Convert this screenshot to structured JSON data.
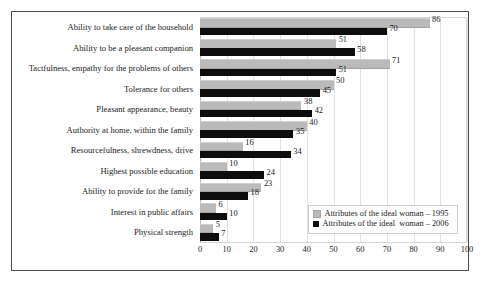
{
  "chart_data": {
    "type": "bar",
    "orientation": "horizontal",
    "title": "",
    "subtitle": "",
    "xlabel": "",
    "ylabel": "",
    "xlim": [
      0,
      100
    ],
    "xticks": [
      0,
      10,
      20,
      30,
      40,
      50,
      60,
      70,
      80,
      90,
      100
    ],
    "grid": true,
    "grid_axis": "x",
    "legend_position": "inside-bottom-right",
    "categories": [
      "Ability to take care of the household",
      "Ability to be a pleasant companion",
      "Tactfulness, empathy for the problems of others",
      "Tolerance for others",
      "Pleasant appearance, beauty",
      "Authority at home, within the family",
      "Resourcefulness, shrewdness, drive",
      "Highest possible education",
      "Ability to provide for the family",
      "Interest in public affairs",
      "Physical strength"
    ],
    "series": [
      {
        "name": "Attributes of the ideal woman – 1995",
        "color": "#bababa",
        "values": [
          86,
          51,
          71,
          50,
          38,
          40,
          16,
          10,
          23,
          6,
          5
        ]
      },
      {
        "name": "Attributes of the ideal  woman – 2006",
        "color": "#0d0d0d",
        "values": [
          70,
          58,
          51,
          45,
          42,
          35,
          34,
          24,
          18,
          10,
          7
        ]
      }
    ]
  },
  "legend": {
    "items": [
      {
        "label": "Attributes of the ideal woman – 1995",
        "swatch": "#bababa"
      },
      {
        "label": "Attributes of the ideal  woman – 2006",
        "swatch": "#0d0d0d"
      }
    ]
  },
  "colors": {
    "series_1995": "#bababa",
    "series_2006": "#0d0d0d",
    "frame": "#4c4c4c",
    "gridline": "#e2e2e2",
    "plot_border": "#d6d6d6",
    "text": "#1c1c1c",
    "background": "#ffffff"
  }
}
